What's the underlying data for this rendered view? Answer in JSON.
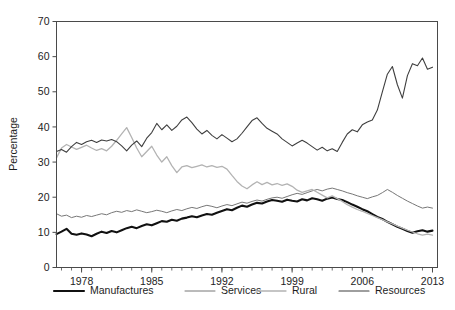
{
  "chart_data": {
    "type": "line",
    "title": "",
    "subtitle": "",
    "xlabel": "",
    "ylabel": "Percentage",
    "ylim": [
      0,
      70
    ],
    "xlim": [
      1975.5,
      2013.5
    ],
    "yticks": [
      0,
      10,
      20,
      30,
      40,
      50,
      60,
      70
    ],
    "xticks": [
      1978,
      1985,
      1992,
      1999,
      2006,
      2013
    ],
    "x_minor_tick_step": 1,
    "grid": false,
    "legend_position": "bottom",
    "legend": [
      "Manufactures",
      "Services",
      "Rural",
      "Resources"
    ],
    "x": [
      1975.5,
      1976,
      1976.5,
      1977,
      1977.5,
      1978,
      1978.5,
      1979,
      1979.5,
      1980,
      1980.5,
      1981,
      1981.5,
      1982,
      1982.5,
      1983,
      1983.5,
      1984,
      1984.5,
      1985,
      1985.5,
      1986,
      1986.5,
      1987,
      1987.5,
      1988,
      1988.5,
      1989,
      1989.5,
      1990,
      1990.5,
      1991,
      1991.5,
      1992,
      1992.5,
      1993,
      1993.5,
      1994,
      1994.5,
      1995,
      1995.5,
      1996,
      1996.5,
      1997,
      1997.5,
      1998,
      1998.5,
      1999,
      1999.5,
      2000,
      2000.5,
      2001,
      2001.5,
      2002,
      2002.5,
      2003,
      2003.5,
      2004,
      2004.5,
      2005,
      2005.5,
      2006,
      2006.5,
      2007,
      2007.5,
      2008,
      2008.5,
      2009,
      2009.5,
      2010,
      2010.5,
      2011,
      2011.5,
      2012,
      2012.5,
      2013
    ],
    "series": [
      {
        "name": "Manufactures",
        "color": "#111111",
        "width": 2.1,
        "values": [
          9.5,
          10.2,
          11.0,
          9.6,
          9.3,
          9.7,
          9.4,
          8.9,
          9.6,
          10.2,
          9.8,
          10.4,
          10.0,
          10.6,
          11.2,
          11.6,
          11.2,
          11.8,
          12.3,
          12.0,
          12.6,
          13.2,
          13.0,
          13.6,
          13.3,
          13.9,
          14.2,
          14.6,
          14.3,
          14.8,
          15.2,
          15.0,
          15.6,
          16.1,
          16.6,
          16.3,
          17.0,
          17.6,
          17.3,
          17.9,
          18.4,
          18.2,
          18.8,
          19.2,
          19.0,
          18.7,
          19.3,
          19.0,
          18.8,
          19.4,
          19.1,
          19.7,
          19.4,
          19.0,
          19.6,
          19.9,
          19.5,
          19.2,
          18.6,
          17.9,
          17.3,
          16.6,
          16.0,
          15.2,
          14.4,
          13.8,
          13.0,
          12.3,
          11.6,
          11.0,
          10.4,
          9.9,
          10.3,
          10.6,
          10.2,
          10.5
        ]
      },
      {
        "name": "Services",
        "color": "#777777",
        "width": 1.0,
        "values": [
          15.3,
          14.6,
          14.9,
          14.2,
          14.6,
          14.3,
          14.8,
          14.5,
          14.9,
          15.3,
          15.0,
          15.6,
          16.0,
          15.7,
          16.2,
          15.9,
          16.4,
          16.0,
          15.6,
          15.9,
          16.3,
          16.0,
          15.6,
          16.1,
          16.5,
          16.2,
          16.7,
          17.1,
          16.8,
          17.3,
          17.7,
          17.4,
          17.0,
          17.5,
          17.9,
          17.6,
          18.1,
          18.6,
          18.3,
          18.8,
          19.2,
          18.9,
          19.4,
          19.8,
          20.0,
          19.7,
          20.2,
          20.7,
          21.1,
          20.8,
          21.3,
          21.8,
          22.2,
          21.8,
          22.3,
          22.6,
          22.2,
          21.8,
          21.3,
          20.9,
          20.4,
          20.0,
          19.6,
          20.1,
          20.5,
          21.3,
          22.2,
          21.4,
          20.5,
          19.7,
          18.9,
          18.2,
          17.5,
          16.9,
          17.2,
          16.9
        ]
      },
      {
        "name": "Rural",
        "color": "#b3b3b3",
        "width": 1.3,
        "values": [
          31.2,
          34.0,
          35.0,
          34.3,
          33.6,
          34.2,
          34.8,
          34.0,
          33.3,
          33.8,
          33.2,
          34.5,
          36.2,
          38.0,
          39.8,
          37.0,
          34.0,
          31.5,
          33.0,
          34.5,
          32.0,
          30.0,
          31.5,
          29.0,
          27.0,
          28.6,
          29.0,
          28.4,
          28.8,
          29.2,
          28.6,
          29.0,
          28.5,
          28.8,
          28.0,
          26.2,
          24.5,
          23.2,
          22.4,
          23.5,
          24.4,
          23.6,
          24.2,
          23.5,
          23.9,
          23.4,
          23.8,
          23.1,
          22.0,
          21.4,
          21.8,
          22.2,
          21.4,
          20.6,
          19.8,
          20.4,
          19.6,
          18.8,
          17.9,
          17.2,
          16.5,
          16.0,
          15.4,
          14.8,
          14.2,
          13.6,
          13.0,
          12.4,
          11.8,
          11.2,
          10.6,
          10.1,
          9.6,
          9.2,
          9.5,
          9.2
        ]
      },
      {
        "name": "Resources",
        "color": "#3f3f3f",
        "width": 1.1,
        "values": [
          33.0,
          33.6,
          32.8,
          34.4,
          35.6,
          35.0,
          35.8,
          36.2,
          35.6,
          36.3,
          36.0,
          36.4,
          35.8,
          34.6,
          33.2,
          34.8,
          36.0,
          34.4,
          36.8,
          38.4,
          41.0,
          39.2,
          40.6,
          39.0,
          40.2,
          42.0,
          42.8,
          41.2,
          39.4,
          38.0,
          39.0,
          37.6,
          36.6,
          37.8,
          36.8,
          35.8,
          36.6,
          38.2,
          40.0,
          41.8,
          42.6,
          41.0,
          39.6,
          38.8,
          38.0,
          36.6,
          35.6,
          34.6,
          35.4,
          36.2,
          35.4,
          34.4,
          33.4,
          34.2,
          33.2,
          33.8,
          33.0,
          35.6,
          38.0,
          39.2,
          38.6,
          40.6,
          41.4,
          42.0,
          44.8,
          50.0,
          55.0,
          57.2,
          52.0,
          48.2,
          54.6,
          58.0,
          57.4,
          59.6,
          56.4,
          57.0
        ]
      }
    ]
  }
}
